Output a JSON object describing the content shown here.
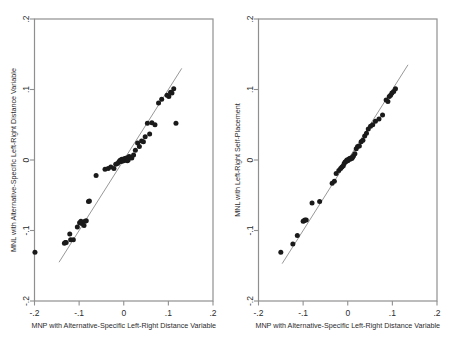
{
  "figure": {
    "background_color": "#ffffff",
    "frame_color": "#8f8f8f",
    "point_color": "#1a1a1a",
    "line_color": "#8c8c8c"
  },
  "chart_data": [
    {
      "type": "scatter",
      "panel": "left",
      "title": "",
      "xlabel": "MNP with Alternative-Specific Left-Right Distance Variable",
      "ylabel": "MNL with Alternative-Specific Left-Right Distance Variable",
      "xlim": [
        -0.2,
        0.2
      ],
      "ylim": [
        -0.2,
        0.2
      ],
      "xticks": [
        -0.2,
        -0.1,
        0,
        0.1,
        0.2
      ],
      "xticklabels": [
        "-.2",
        "-.1",
        "0",
        ".1",
        ".2"
      ],
      "yticks": [
        -0.2,
        -0.1,
        0,
        0.1,
        0.2
      ],
      "yticklabels": [
        "-.2",
        "-.1",
        "0",
        ".1",
        ".2"
      ],
      "grid": false,
      "legend": "none",
      "reference_line": {
        "type": "identity",
        "slope": 1,
        "intercept": 0,
        "x_start": -0.145,
        "x_end": 0.13
      },
      "x": [
        -0.199,
        -0.133,
        -0.131,
        -0.129,
        -0.121,
        -0.119,
        -0.113,
        -0.104,
        -0.099,
        -0.096,
        -0.094,
        -0.089,
        -0.087,
        -0.084,
        -0.079,
        -0.077,
        -0.062,
        -0.042,
        -0.035,
        -0.029,
        -0.022,
        -0.018,
        -0.014,
        -0.011,
        -0.009,
        -0.007,
        -0.005,
        -0.004,
        -0.002,
        0.0,
        0.002,
        0.004,
        0.006,
        0.008,
        0.01,
        0.012,
        0.015,
        0.018,
        0.022,
        0.026,
        0.031,
        0.035,
        0.04,
        0.044,
        0.048,
        0.053,
        0.058,
        0.063,
        0.07,
        0.078,
        0.085,
        0.097,
        0.101,
        0.105,
        0.108,
        0.112,
        0.117
      ],
      "y": [
        -0.131,
        -0.118,
        -0.117,
        -0.117,
        -0.105,
        -0.113,
        -0.113,
        -0.095,
        -0.089,
        -0.087,
        -0.09,
        -0.093,
        -0.087,
        -0.086,
        -0.059,
        -0.058,
        -0.022,
        -0.013,
        -0.012,
        -0.01,
        -0.012,
        -0.006,
        -0.005,
        -0.003,
        -0.001,
        0.0,
        -0.002,
        0.001,
        0.0,
        -0.001,
        0.002,
        0.001,
        0.003,
        -0.001,
        0.0,
        0.005,
        0.004,
        0.003,
        0.007,
        0.014,
        0.024,
        0.019,
        0.027,
        0.026,
        0.033,
        0.052,
        0.037,
        0.053,
        0.05,
        0.081,
        0.086,
        0.092,
        0.09,
        0.096,
        0.095,
        0.101,
        0.052
      ]
    },
    {
      "type": "scatter",
      "panel": "right",
      "title": "",
      "xlabel": "MNP with Alternative-Specific Left-Right Distance Variable",
      "ylabel": "MNL with Left-Right Self-Placement",
      "xlim": [
        -0.2,
        0.2
      ],
      "ylim": [
        -0.2,
        0.2
      ],
      "xticks": [
        -0.2,
        -0.1,
        0,
        0.1,
        0.2
      ],
      "xticklabels": [
        "-.2",
        "-.1",
        "0",
        ".1",
        ".2"
      ],
      "yticks": [
        -0.2,
        -0.1,
        0,
        0.1,
        0.2
      ],
      "yticklabels": [
        "-.2",
        "-.1",
        "0",
        ".1",
        ".2"
      ],
      "grid": false,
      "legend": "none",
      "reference_line": {
        "type": "identity",
        "slope": 1,
        "intercept": 0,
        "x_start": -0.147,
        "x_end": 0.135
      },
      "x": [
        -0.15,
        -0.123,
        -0.113,
        -0.1,
        -0.098,
        -0.096,
        -0.093,
        -0.08,
        -0.063,
        -0.035,
        -0.03,
        -0.026,
        -0.02,
        -0.016,
        -0.013,
        -0.01,
        -0.008,
        -0.006,
        -0.004,
        -0.002,
        0.0,
        0.002,
        0.004,
        0.005,
        0.007,
        0.009,
        0.011,
        0.013,
        0.016,
        0.019,
        0.022,
        0.026,
        0.03,
        0.034,
        0.038,
        0.042,
        0.046,
        0.051,
        0.056,
        0.062,
        0.07,
        0.078,
        0.086,
        0.09,
        0.093,
        0.096,
        0.099,
        0.103,
        0.107
      ],
      "y": [
        -0.131,
        -0.119,
        -0.107,
        -0.087,
        -0.086,
        -0.085,
        -0.085,
        -0.061,
        -0.059,
        -0.033,
        -0.03,
        -0.019,
        -0.015,
        -0.012,
        -0.01,
        -0.008,
        -0.005,
        -0.003,
        -0.002,
        0.0,
        -0.001,
        0.001,
        0.002,
        0.001,
        0.003,
        0.002,
        0.004,
        0.006,
        0.009,
        0.016,
        0.019,
        0.02,
        0.026,
        0.028,
        0.034,
        0.038,
        0.044,
        0.048,
        0.05,
        0.055,
        0.058,
        0.064,
        0.085,
        0.083,
        0.09,
        0.092,
        0.095,
        0.097,
        0.101
      ]
    }
  ]
}
